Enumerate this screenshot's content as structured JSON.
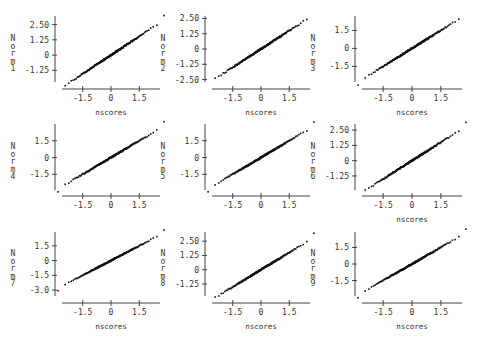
{
  "chart_data": [
    {
      "type": "scatter",
      "title": "",
      "xlabel": "nscores",
      "ylabel": "Norm1",
      "xticks": [
        "-1.5",
        "0",
        "1.5"
      ],
      "yticks": [
        "2.50",
        "1.25",
        "0",
        "-1.25"
      ],
      "ytick_values": [
        2.5,
        1.25,
        0,
        -1.25
      ],
      "xlim": [
        -2.6,
        2.6
      ],
      "ylim": [
        -2.2,
        3.2
      ],
      "slope": 1.02,
      "show_xlabel": true
    },
    {
      "type": "scatter",
      "title": "",
      "xlabel": "nscores",
      "ylabel": "Norm2",
      "xticks": [
        "-1.5",
        "0",
        "1.5"
      ],
      "yticks": [
        "2.50",
        "1.25",
        "0",
        "-1.25",
        "-2.50"
      ],
      "ytick_values": [
        2.5,
        1.25,
        0,
        -1.25,
        -2.5
      ],
      "xlim": [
        -2.6,
        2.6
      ],
      "ylim": [
        -2.7,
        2.7
      ],
      "slope": 1.0,
      "show_xlabel": true
    },
    {
      "type": "scatter",
      "title": "",
      "xlabel": "nscores",
      "ylabel": "Norm3",
      "xticks": [
        "-1.5",
        "0",
        "1.5"
      ],
      "yticks": [
        "1.5",
        "0",
        "-1.5"
      ],
      "ytick_values": [
        1.5,
        0,
        -1.5
      ],
      "xlim": [
        -2.6,
        2.6
      ],
      "ylim": [
        -2.8,
        2.7
      ],
      "slope": 1.0,
      "show_xlabel": true
    },
    {
      "type": "scatter",
      "title": "",
      "xlabel": "nscores",
      "ylabel": "Norm4",
      "xticks": [
        "-1.5",
        "0",
        "1.5"
      ],
      "yticks": [
        "1.5",
        "0",
        "-1.5"
      ],
      "ytick_values": [
        1.5,
        0,
        -1.5
      ],
      "xlim": [
        -2.6,
        2.6
      ],
      "ylim": [
        -2.9,
        3.0
      ],
      "slope": 1.0,
      "show_xlabel": false
    },
    {
      "type": "scatter",
      "title": "",
      "xlabel": "nscores",
      "ylabel": "Norm5",
      "xticks": [
        "-1.5",
        "0",
        "1.5"
      ],
      "yticks": [
        "1.5",
        "0",
        "-1.5"
      ],
      "ytick_values": [
        1.5,
        0,
        -1.5
      ],
      "xlim": [
        -2.6,
        2.6
      ],
      "ylim": [
        -2.9,
        3.0
      ],
      "slope": 1.0,
      "show_xlabel": false
    },
    {
      "type": "scatter",
      "title": "",
      "xlabel": "nscores",
      "ylabel": "Norm6",
      "xticks": [
        "-1.5",
        "0",
        "1.5"
      ],
      "yticks": [
        "2.50",
        "1.25",
        "0",
        "-1.25"
      ],
      "ytick_values": [
        2.5,
        1.25,
        0,
        -1.25
      ],
      "xlim": [
        -2.6,
        2.6
      ],
      "ylim": [
        -2.4,
        3.0
      ],
      "slope": 1.0,
      "show_xlabel": true
    },
    {
      "type": "scatter",
      "title": "",
      "xlabel": "nscores",
      "ylabel": "Norm7",
      "xticks": [
        "-1.5",
        "0",
        "1.5"
      ],
      "yticks": [
        "1.5",
        "0",
        "-1.5",
        "-3.0"
      ],
      "ytick_values": [
        1.5,
        0,
        -1.5,
        -3.0
      ],
      "xlim": [
        -2.6,
        2.6
      ],
      "ylim": [
        -3.6,
        2.9
      ],
      "slope": 1.0,
      "show_xlabel": true
    },
    {
      "type": "scatter",
      "title": "",
      "xlabel": "nscores",
      "ylabel": "Norm8",
      "xticks": [
        "-1.5",
        "0",
        "1.5"
      ],
      "yticks": [
        "2.50",
        "1.25",
        "0",
        "-1.25"
      ],
      "ytick_values": [
        2.5,
        1.25,
        0,
        -1.25
      ],
      "xlim": [
        -2.6,
        2.6
      ],
      "ylim": [
        -2.3,
        3.3
      ],
      "slope": 1.0,
      "show_xlabel": true
    },
    {
      "type": "scatter",
      "title": "",
      "xlabel": "nscores",
      "ylabel": "Norm9",
      "xticks": [
        "-1.5",
        "0",
        "1.5"
      ],
      "yticks": [
        "1.5",
        "0",
        "-1.5"
      ],
      "ytick_values": [
        1.5,
        0,
        -1.5
      ],
      "xlim": [
        -2.6,
        2.6
      ],
      "ylim": [
        -2.9,
        2.9
      ],
      "slope": 1.0,
      "show_xlabel": true
    }
  ]
}
